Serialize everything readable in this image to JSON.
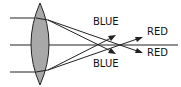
{
  "diagram": {
    "labels": {
      "blue_top": "BLUE",
      "blue_bottom": "BLUE",
      "red_top": "RED",
      "red_bottom": "RED"
    },
    "colors": {
      "lens_fill": "#a8a8a8",
      "stroke": "#222222",
      "background": "#ffffff"
    }
  }
}
